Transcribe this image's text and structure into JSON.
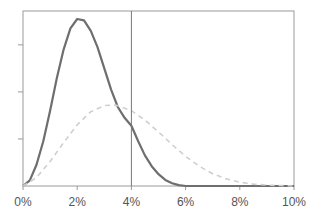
{
  "chart_data": {
    "type": "line",
    "title": "",
    "xlabel": "",
    "ylabel": "",
    "xlim": [
      0,
      10
    ],
    "ylim": [
      0,
      3.72
    ],
    "x_ticks": [
      0,
      2,
      4,
      6,
      8,
      10
    ],
    "x_tick_labels": [
      "0%",
      "2%",
      "4%",
      "6%",
      "8%",
      "10%"
    ],
    "y_ticks": [
      1,
      2,
      3
    ],
    "y_tick_labels": [
      "",
      "",
      ""
    ],
    "grid": false,
    "legend": "none",
    "reference_line": {
      "x": 4,
      "color": "#777777"
    },
    "series": [
      {
        "name": "solid-distribution",
        "style": "solid",
        "color": "#6e6e6e",
        "x": [
          0,
          0.25,
          0.5,
          0.75,
          1.0,
          1.25,
          1.5,
          1.75,
          2.0,
          2.25,
          2.5,
          2.75,
          3.0,
          3.25,
          3.5,
          3.75,
          4.0,
          4.25,
          4.5,
          4.75,
          5.0,
          5.25,
          5.5,
          5.75,
          6.0,
          7.0,
          8.0,
          10.0
        ],
        "y": [
          0,
          0.12,
          0.45,
          0.95,
          1.6,
          2.3,
          2.9,
          3.35,
          3.55,
          3.52,
          3.3,
          2.95,
          2.5,
          2.05,
          1.68,
          1.45,
          1.28,
          0.95,
          0.65,
          0.42,
          0.25,
          0.13,
          0.06,
          0.02,
          0.0,
          0,
          0,
          0
        ]
      },
      {
        "name": "dashed-distribution",
        "style": "dashed",
        "color": "#cfcfcf",
        "x": [
          0,
          0.5,
          1.0,
          1.5,
          2.0,
          2.5,
          3.0,
          3.3,
          3.5,
          4.0,
          4.5,
          5.0,
          5.5,
          6.0,
          6.5,
          7.0,
          7.5,
          8.0,
          8.5,
          9.0,
          9.5,
          10.0
        ],
        "y": [
          0,
          0.18,
          0.52,
          0.92,
          1.3,
          1.58,
          1.71,
          1.72,
          1.71,
          1.6,
          1.4,
          1.15,
          0.88,
          0.63,
          0.42,
          0.26,
          0.15,
          0.08,
          0.04,
          0.02,
          0.01,
          0.0
        ]
      }
    ]
  }
}
